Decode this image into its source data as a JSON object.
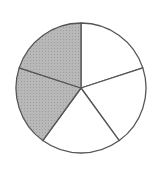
{
  "chart_data": {
    "type": "pie",
    "title": "",
    "total_parts": 5,
    "shaded_parts": 2,
    "fraction": "2/5",
    "categories": [
      "part-1",
      "part-2",
      "part-3",
      "part-4",
      "part-5"
    ],
    "values": [
      1,
      1,
      1,
      1,
      1
    ],
    "shaded": [
      false,
      false,
      false,
      true,
      true
    ],
    "colors": {
      "shaded": "#b3b3b3",
      "unshaded": "#ffffff",
      "stroke": "#555555"
    },
    "center": [
      81,
      88
    ],
    "radius": 65,
    "start_angle_deg": -90
  }
}
